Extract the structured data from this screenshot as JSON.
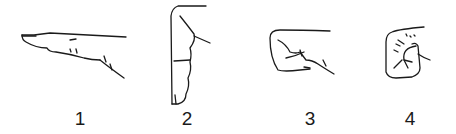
{
  "figure": {
    "panels": [
      {
        "label": "1",
        "description": "extended finger, side view"
      },
      {
        "label": "2",
        "description": "finger pointing down, flexed"
      },
      {
        "label": "3",
        "description": "fist, side view"
      },
      {
        "label": "4",
        "description": "fist, front view"
      }
    ]
  }
}
